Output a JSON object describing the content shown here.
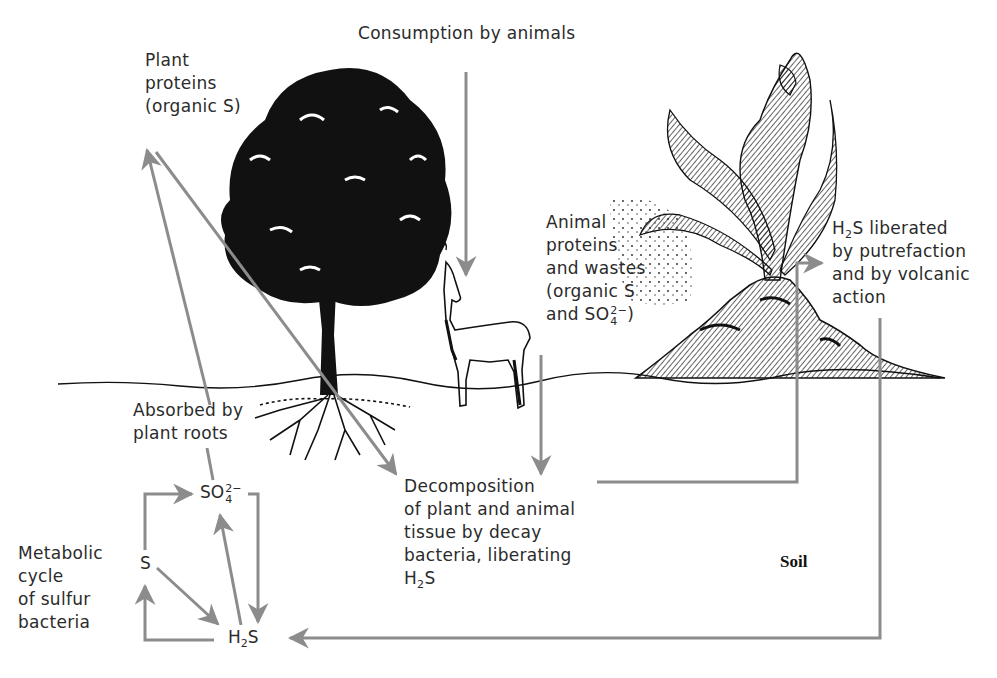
{
  "colors": {
    "arrow": "#8c8c8c",
    "text": "#2b2b2b",
    "illustration": "#111111",
    "background": "#ffffff"
  },
  "labels": {
    "plant_proteins": [
      "Plant",
      "proteins",
      "(organic S)"
    ],
    "consumption": "Consumption by animals",
    "animal_proteins": [
      "Animal",
      "proteins",
      "and wastes",
      "(organic S",
      "and SO"
    ],
    "animal_proteins_ion": {
      "base": "and SO",
      "sub": "4",
      "sup": "2−",
      "suffix": ")"
    },
    "h2s_liberated": {
      "line1_prefix": "H",
      "line1_sub": "2",
      "line1_suffix": "S liberated",
      "lines": [
        "by putrefaction",
        "and by volcanic",
        "action"
      ]
    },
    "absorbed": [
      "Absorbed by",
      "plant roots"
    ],
    "decomposition": [
      "Decomposition",
      "of plant and animal",
      "tissue by decay",
      "bacteria, liberating"
    ],
    "decomposition_h2s": {
      "prefix": "H",
      "sub": "2",
      "suffix": "S"
    },
    "metabolic": [
      "Metabolic",
      "cycle",
      "of sulfur",
      "bacteria"
    ],
    "soil": "Soil"
  },
  "cycle_nodes": {
    "sulfate": {
      "base": "SO",
      "sub": "4",
      "sup": "2−"
    },
    "sulfur": "S",
    "hydrogen_sulfide": {
      "prefix": "H",
      "sub": "2",
      "suffix": "S"
    }
  },
  "illustrations": [
    "tree",
    "llama",
    "volcano",
    "ground-line",
    "roots"
  ]
}
